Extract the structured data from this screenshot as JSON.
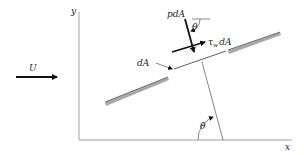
{
  "diagram": {
    "axes": {
      "x_label": "x",
      "y_label": "y"
    },
    "freestream": {
      "label": "U"
    },
    "element": {
      "label": "dA"
    },
    "forces": {
      "pressure": {
        "label": "pdA"
      },
      "shear": {
        "label_main": "τ",
        "label_sub": "w",
        "label_suffix": "dA"
      }
    },
    "angles": {
      "top": "θ",
      "bottom": "θ"
    },
    "colors": {
      "line": "#222222",
      "plate": "#9a9a9a",
      "plate_edge": "#555555"
    }
  }
}
